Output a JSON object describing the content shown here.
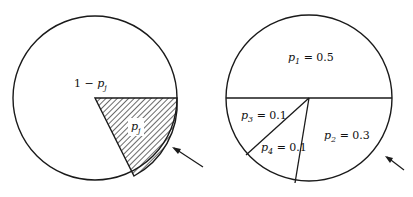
{
  "figure": {
    "left_pie": {
      "complement_label": {
        "prefix": "1 − ",
        "var": "p",
        "sub": "j"
      },
      "slice_label": {
        "var": "p",
        "sub": "j"
      },
      "slice_fill": "hatched"
    },
    "right_pie": {
      "slices": [
        {
          "var": "p",
          "sub": "1",
          "value_text": " = 0.5",
          "value": 0.5
        },
        {
          "var": "p",
          "sub": "2",
          "value_text": " = 0.3",
          "value": 0.3
        },
        {
          "var": "p",
          "sub": "3",
          "value_text": " = 0.1",
          "value": 0.1
        },
        {
          "var": "p",
          "sub": "4",
          "value_text": " = 0.1",
          "value": 0.1
        }
      ]
    },
    "colors": {
      "stroke": "#1a1a1a",
      "background": "#ffffff"
    }
  }
}
